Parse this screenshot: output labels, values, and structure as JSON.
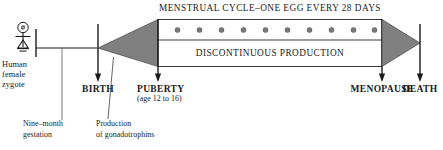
{
  "diagram": {
    "colors": {
      "ink": "#1a1a1a",
      "wedge_gray": "#808080",
      "egg_dot": "#7a7a7a",
      "background": "#ffffff"
    },
    "top_banner": {
      "text": "MENSTRUAL CYCLE–ONE EGG EVERY 28 DAYS"
    },
    "chamber_lower": {
      "text": "DISCONTINUOUS PRODUCTION"
    },
    "egg_dots": {
      "count": 10,
      "label": "one egg every 28 days"
    },
    "milestones": [
      {
        "name": "birth",
        "label": "BIRTH"
      },
      {
        "name": "puberty",
        "label": "PUBERTY",
        "sublabel": "(age 12 to 16)"
      },
      {
        "name": "menopause",
        "label": "MENOPAUSE"
      },
      {
        "name": "death",
        "label": "DEATH"
      }
    ],
    "start_label": {
      "line1": "Human",
      "line2": "female",
      "line3": "zygote"
    },
    "annotations": [
      {
        "name": "gestation",
        "line1": "Nine–month",
        "line2": "gestation"
      },
      {
        "name": "gonadotrophins",
        "line1": "Production",
        "line2": "of gonadotrophins"
      }
    ]
  }
}
